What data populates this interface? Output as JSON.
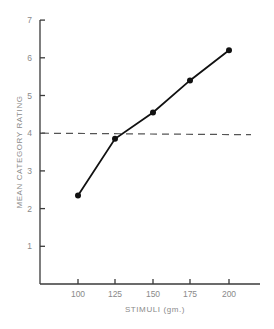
{
  "chart_data": {
    "type": "line",
    "title": "",
    "xlabel": "STIMULI  (gm.)",
    "ylabel": "MEAN  CATEGORY  RATING",
    "categories": [
      "100",
      "125",
      "150",
      "175",
      "200"
    ],
    "x": [
      100,
      125,
      150,
      175,
      200
    ],
    "series": [
      {
        "name": "Mean category rating",
        "values": [
          2.35,
          3.85,
          4.55,
          5.4,
          6.2
        ],
        "style": "solid",
        "markers": "filled-circle"
      }
    ],
    "reference_lines": [
      {
        "orientation": "horizontal",
        "value": 4.0,
        "style": "dashed"
      }
    ],
    "ylim": [
      0,
      7
    ],
    "yticks": [
      1,
      2,
      3,
      4,
      5,
      6,
      7
    ],
    "xticks": [
      100,
      125,
      150,
      175,
      200
    ],
    "grid": false,
    "legend": null
  },
  "labels": {
    "ytick_labels": [
      "1",
      "2",
      "3",
      "4",
      "5",
      "6",
      "7"
    ],
    "xtick_labels": [
      "100",
      "125",
      "150",
      "175",
      "200"
    ],
    "xlabel": "STIMULI  (gm.)",
    "ylabel": "MEAN  CATEGORY  RATING"
  }
}
